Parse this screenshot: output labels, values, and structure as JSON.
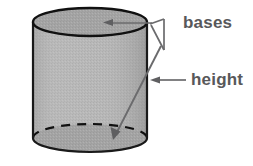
{
  "figure": {
    "kind": "geometry-diagram",
    "background_color": "#ffffff",
    "shape": {
      "name": "cylinder",
      "body_fill": "#b4b4b4",
      "base_fill": "#a0a0a0",
      "outline_color": "#1a1a1a",
      "hidden_edge_style": "dashed",
      "center_x": 90,
      "top_center_y": 22,
      "bottom_center_y": 138,
      "radius_x": 57,
      "radius_y": 14
    },
    "labels": [
      {
        "id": "bases",
        "text": "bases",
        "color": "#58585a",
        "x": 183,
        "y": 14,
        "pointers": [
          {
            "to": "top-base",
            "arrow_tip_x": 105,
            "arrow_tip_y": 22
          },
          {
            "to": "bottom-base",
            "arrow_tip_x": 113,
            "arrow_tip_y": 137
          }
        ]
      },
      {
        "id": "height",
        "text": "height",
        "color": "#58585a",
        "x": 191,
        "y": 71,
        "pointers": [
          {
            "to": "lateral-side",
            "arrow_tip_x": 150,
            "arrow_tip_y": 80
          }
        ]
      }
    ],
    "leader_color": "#6b6b6d"
  }
}
